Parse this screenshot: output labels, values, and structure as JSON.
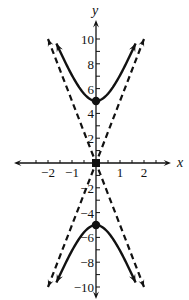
{
  "chart_data": {
    "type": "line",
    "title": "",
    "xlabel": "x",
    "ylabel": "y",
    "xlim": [
      -2.6,
      3.0
    ],
    "ylim": [
      -11,
      11.5
    ],
    "grid": false,
    "legend": null,
    "x_ticks": [
      -2,
      -1,
      1,
      2
    ],
    "x_tick_labels": [
      "−2",
      "−1",
      "1",
      "2"
    ],
    "x_minor_step": 0.5,
    "y_ticks": [
      -10,
      -8,
      -6,
      -4,
      -2,
      2,
      4,
      6,
      8,
      10
    ],
    "y_tick_labels": [
      "−10",
      "−8",
      "−6",
      "−4",
      "−2",
      "2",
      "4",
      "6",
      "8",
      "10"
    ],
    "y_minor_step": 1,
    "series": [
      {
        "name": "hyperbola upper branch",
        "equation": "y^2/25 - x^2 = 1",
        "style": "solid",
        "x": [
          -1.65,
          -1.5,
          -1.0,
          -0.5,
          0,
          0.5,
          1.0,
          1.5,
          1.65
        ],
        "y": [
          9.65,
          9.01,
          7.07,
          5.59,
          5.0,
          5.59,
          7.07,
          9.01,
          9.65
        ]
      },
      {
        "name": "hyperbola lower branch",
        "equation": "y^2/25 - x^2 = 1",
        "style": "solid",
        "x": [
          -1.65,
          -1.5,
          -1.0,
          -0.5,
          0,
          0.5,
          1.0,
          1.5,
          1.65
        ],
        "y": [
          -9.65,
          -9.01,
          -7.07,
          -5.59,
          -5.0,
          -5.59,
          -7.07,
          -9.01,
          -9.65
        ]
      },
      {
        "name": "asymptote y = 5x",
        "style": "dashed",
        "x": [
          -2,
          2
        ],
        "y": [
          -10,
          10
        ]
      },
      {
        "name": "asymptote y = -5x",
        "style": "dashed",
        "x": [
          -2,
          2
        ],
        "y": [
          10,
          -10
        ]
      }
    ],
    "points": [
      {
        "label": "vertex",
        "x": 0,
        "y": 5
      },
      {
        "label": "vertex",
        "x": 0,
        "y": -5
      },
      {
        "label": "center",
        "x": 0,
        "y": 0
      }
    ]
  },
  "colors": {
    "ink": "#111111",
    "background": "#ffffff"
  }
}
